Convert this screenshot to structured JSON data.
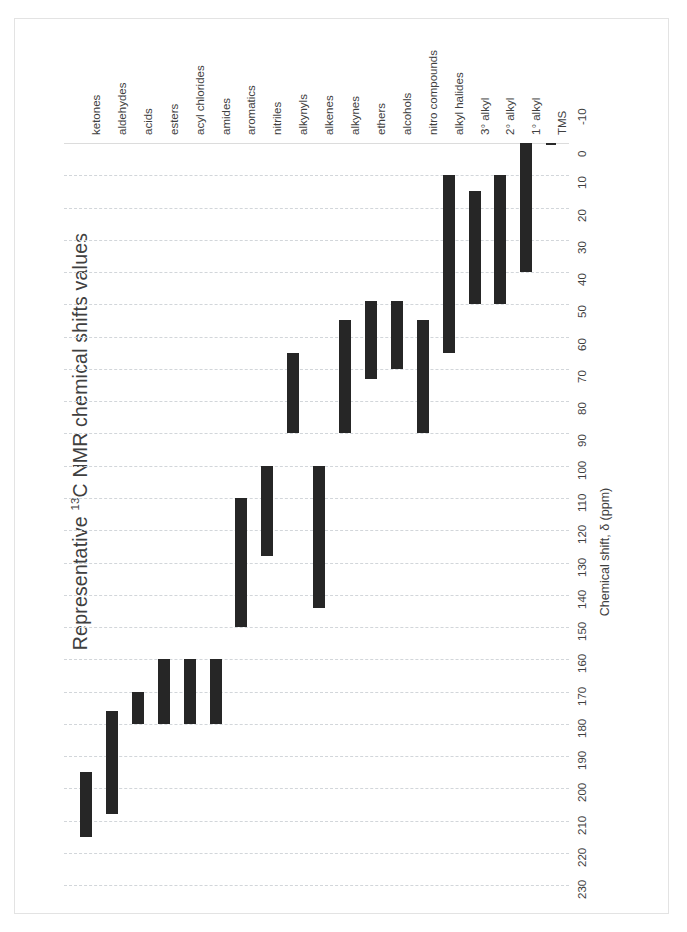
{
  "chart_data": {
    "type": "bar",
    "orientation": "vertical-ranges",
    "title": "Representative 13C NMR chemical shifts values",
    "title_prefix": "Representative ",
    "title_sup": "13",
    "title_suffix": "C NMR chemical shifts values",
    "xlabel": "",
    "ylabel": "Chemical shift, δ (ppm)",
    "ylim": [
      -10,
      230
    ],
    "y_tick_step": 10,
    "y_ticks": [
      "-10",
      "0",
      "10",
      "20",
      "30",
      "40",
      "50",
      "60",
      "70",
      "80",
      "90",
      "100",
      "110",
      "120",
      "130",
      "140",
      "150",
      "160",
      "170",
      "180",
      "190",
      "200",
      "210",
      "220",
      "230"
    ],
    "y_axis_inverted": true,
    "grid": true,
    "legend": "none",
    "bar_color": "#262626",
    "grid_color": "#d2d6da",
    "categories": [
      "ketones",
      "aldehydes",
      "acids",
      "esters",
      "acyl chlorides",
      "amides",
      "aromatics",
      "nitriles",
      "alkynyls",
      "alkenes",
      "alkynes",
      "ethers",
      "alcohols",
      "nitro compounds",
      "alkyl halides",
      "3° alkyl",
      "2° alkyl",
      "1° alkyl",
      "TMS"
    ],
    "ranges": [
      {
        "label": "ketones",
        "low": 195,
        "high": 215,
        "sup": ""
      },
      {
        "label": "aldehydes",
        "low": 176,
        "high": 208,
        "sup": ""
      },
      {
        "label": "acids",
        "low": 170,
        "high": 180,
        "sup": ""
      },
      {
        "label": "esters",
        "low": 160,
        "high": 180,
        "sup": ""
      },
      {
        "label": "acyl chlorides",
        "low": 160,
        "high": 180,
        "sup": ""
      },
      {
        "label": "amides",
        "low": 160,
        "high": 180,
        "sup": ""
      },
      {
        "label": "aromatics",
        "low": 110,
        "high": 150,
        "sup": ""
      },
      {
        "label": "nitriles",
        "low": 100,
        "high": 128,
        "sup": ""
      },
      {
        "label": "alkynyls",
        "low": 65,
        "high": 90,
        "sup": ""
      },
      {
        "label": "alkenes",
        "low": 100,
        "high": 144,
        "sup": ""
      },
      {
        "label": "alkynes",
        "low": 55,
        "high": 90,
        "sup": ""
      },
      {
        "label": "ethers",
        "low": 49,
        "high": 73,
        "sup": ""
      },
      {
        "label": "alcohols",
        "low": 49,
        "high": 70,
        "sup": ""
      },
      {
        "label": "nitro compounds",
        "low": 55,
        "high": 90,
        "sup": ""
      },
      {
        "label": "alkyl halides",
        "low": 10,
        "high": 65,
        "sup": ""
      },
      {
        "label": "3° alkyl",
        "low": 15,
        "high": 50,
        "sup": "°"
      },
      {
        "label": "2° alkyl",
        "low": 10,
        "high": 50,
        "sup": "°"
      },
      {
        "label": "1° alkyl",
        "low": 0,
        "high": 40,
        "sup": "°"
      },
      {
        "label": "TMS",
        "low": 0,
        "high": 0,
        "sup": ""
      }
    ]
  }
}
